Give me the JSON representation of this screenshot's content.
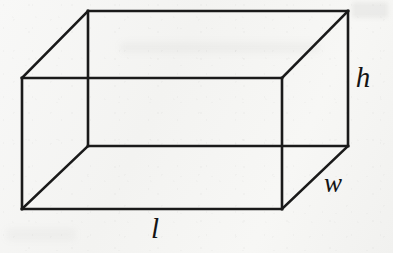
{
  "figure": {
    "name": "rectangular-prism",
    "caption": "",
    "stroke_color": "#1a1a1a",
    "background_color": "#f5f5f3",
    "stroke_width": 2.6,
    "canvas": {
      "width": 393,
      "height": 253
    }
  },
  "labels": {
    "height": "h",
    "width": "w",
    "length": "l"
  },
  "geometry": {
    "projection": "oblique",
    "depth_offset": {
      "dx": 66,
      "dy": -67
    },
    "front_face": {
      "top_left": [
        22,
        78
      ],
      "top_right": [
        282,
        78
      ],
      "bottom_right": [
        282,
        209
      ],
      "bottom_left": [
        22,
        209
      ]
    },
    "back_face": {
      "top_left": [
        88,
        11
      ],
      "top_right": [
        348,
        11
      ],
      "bottom_right": [
        348,
        146
      ],
      "bottom_left": [
        88,
        146
      ]
    },
    "label_anchors": {
      "h": [
        363,
        77
      ],
      "w": [
        333,
        183
      ],
      "l": [
        155,
        228
      ]
    }
  },
  "chart_data": {
    "type": "diagram",
    "title": "",
    "shape": "rectangular prism",
    "dimension_labels": [
      "l",
      "w",
      "h"
    ],
    "edges": [
      {
        "name": "front-top",
        "from": [
          22,
          78
        ],
        "to": [
          282,
          78
        ],
        "visible": true
      },
      {
        "name": "front-right",
        "from": [
          282,
          78
        ],
        "to": [
          282,
          209
        ],
        "visible": true
      },
      {
        "name": "front-bottom",
        "from": [
          22,
          209
        ],
        "to": [
          282,
          209
        ],
        "visible": true
      },
      {
        "name": "front-left",
        "from": [
          22,
          78
        ],
        "to": [
          22,
          209
        ],
        "visible": true
      },
      {
        "name": "back-top",
        "from": [
          88,
          11
        ],
        "to": [
          348,
          11
        ],
        "visible": true
      },
      {
        "name": "back-right",
        "from": [
          348,
          11
        ],
        "to": [
          348,
          146
        ],
        "visible": true
      },
      {
        "name": "back-bottom",
        "from": [
          88,
          146
        ],
        "to": [
          348,
          146
        ],
        "visible": true
      },
      {
        "name": "back-left",
        "from": [
          88,
          11
        ],
        "to": [
          88,
          146
        ],
        "visible": true
      },
      {
        "name": "connect-top-left",
        "from": [
          22,
          78
        ],
        "to": [
          88,
          11
        ],
        "visible": true
      },
      {
        "name": "connect-top-right",
        "from": [
          282,
          78
        ],
        "to": [
          348,
          11
        ],
        "visible": true
      },
      {
        "name": "connect-bottom-left",
        "from": [
          22,
          209
        ],
        "to": [
          88,
          146
        ],
        "visible": true
      },
      {
        "name": "connect-bottom-right",
        "from": [
          282,
          209
        ],
        "to": [
          348,
          146
        ],
        "visible": true
      }
    ]
  }
}
